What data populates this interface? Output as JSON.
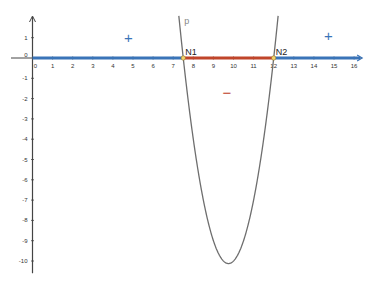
{
  "chart_data": {
    "type": "line",
    "title": "",
    "xlabel": "",
    "ylabel": "",
    "xlim": [
      -0.2,
      16.4
    ],
    "ylim": [
      -10.5,
      2
    ],
    "grid": false,
    "x_ticks": [
      0,
      1,
      2,
      3,
      4,
      5,
      6,
      7,
      8,
      9,
      10,
      11,
      12,
      13,
      14,
      15,
      16
    ],
    "y_ticks": [
      1,
      0,
      -1,
      -2,
      -3,
      -4,
      -5,
      -6,
      -7,
      -8,
      -9,
      -10
    ],
    "curve": {
      "name": "p",
      "formula": "p(x) = 2(x-7.5)(x-12)",
      "roots": [
        7.5,
        12
      ],
      "vertex": [
        9.75,
        -10.125
      ],
      "color": "#6e6e6e"
    },
    "points": [
      {
        "label": "N1",
        "x": 7.5,
        "y": 0
      },
      {
        "label": "N2",
        "x": 12,
        "y": 0
      }
    ],
    "sign_chart": [
      {
        "from": 0,
        "to": 7.5,
        "sign": "+",
        "color": "#3a74b8"
      },
      {
        "from": 7.5,
        "to": 12,
        "sign": "−",
        "color": "#c0452a"
      },
      {
        "from": 12,
        "to": 16.3,
        "sign": "+",
        "color": "#3a74b8"
      }
    ]
  },
  "labels": {
    "curve": "p",
    "n1": "N1",
    "n2": "N2",
    "plus_left": "+",
    "minus_mid": "−",
    "plus_right": "+"
  },
  "colors": {
    "positive": "#3a74b8",
    "negative": "#c0452a",
    "axis": "#444444",
    "curve": "#6e6e6e",
    "point": "#f3d36b"
  }
}
